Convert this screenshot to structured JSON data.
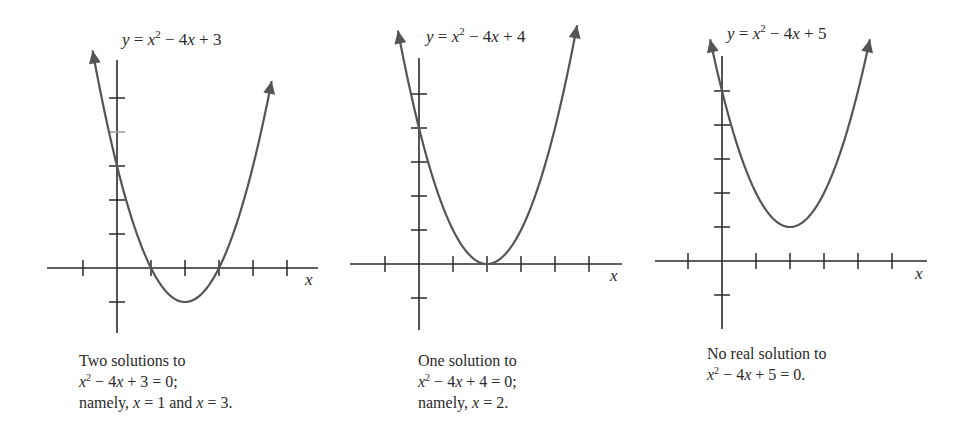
{
  "chart_data": [
    {
      "type": "line",
      "title": "y = x^2 - 4x + 3",
      "function": "x^2 - 4x + 3",
      "xlabel": "x",
      "ylabel": "",
      "xticks": [
        -1,
        0,
        1,
        2,
        3,
        4,
        5
      ],
      "yticks": [
        -1,
        1,
        2,
        3,
        4,
        5
      ],
      "vertex": [
        2,
        -1
      ],
      "roots": [
        1,
        3
      ],
      "y_intercept": 3,
      "xlim": [
        -2,
        6
      ],
      "ylim": [
        -2,
        6.3
      ],
      "grid": false,
      "caption": [
        "Two solutions to",
        "x^2 - 4x + 3 = 0;",
        "namely, x = 1 and x = 3."
      ]
    },
    {
      "type": "line",
      "title": "y = x^2 - 4x + 4",
      "function": "x^2 - 4x + 4",
      "xlabel": "x",
      "ylabel": "",
      "xticks": [
        -1,
        0,
        1,
        2,
        3,
        4,
        5
      ],
      "yticks": [
        -1,
        1,
        2,
        3,
        4,
        5
      ],
      "vertex": [
        2,
        0
      ],
      "roots": [
        2
      ],
      "y_intercept": 4,
      "xlim": [
        -2,
        6
      ],
      "ylim": [
        -2,
        6.3
      ],
      "grid": false,
      "caption": [
        "One solution to",
        "x^2 - 4x + 4 = 0;",
        "namely, x = 2."
      ]
    },
    {
      "type": "line",
      "title": "y = x^2 - 4x + 5",
      "function": "x^2 - 4x + 5",
      "xlabel": "x",
      "ylabel": "",
      "xticks": [
        -1,
        0,
        1,
        2,
        3,
        4,
        5
      ],
      "yticks": [
        -1,
        1,
        2,
        3,
        4,
        5
      ],
      "vertex": [
        2,
        1
      ],
      "roots": [],
      "y_intercept": 5,
      "xlim": [
        -2,
        6
      ],
      "ylim": [
        -2,
        6.3
      ],
      "grid": false,
      "caption": [
        "No real solution to",
        "x^2 - 4x + 5 = 0."
      ]
    }
  ],
  "graphs": [
    {
      "eq": {
        "y": "y",
        "eqs": " = ",
        "x": "x",
        "pow": "2",
        "rest1": " − 4",
        "x2": "x",
        "rest2": " + 3"
      },
      "axis_label": "x",
      "caption": {
        "line1": "Two solutions to",
        "line2": {
          "x": "x",
          "pow": "2",
          "rest": " − 4",
          "x2": "x",
          "tail": " + 3 = 0;"
        },
        "line3": {
          "pre": "namely, ",
          "x1": "x",
          "mid": " = 1 and ",
          "x2": "x",
          "tail": " = 3."
        }
      }
    },
    {
      "eq": {
        "y": "y",
        "eqs": " = ",
        "x": "x",
        "pow": "2",
        "rest1": " − 4",
        "x2": "x",
        "rest2": " + 4"
      },
      "axis_label": "x",
      "caption": {
        "line1": "One solution to",
        "line2": {
          "x": "x",
          "pow": "2",
          "rest": " − 4",
          "x2": "x",
          "tail": " + 4 = 0;"
        },
        "line3": {
          "pre": "namely, ",
          "x1": "x",
          "tail": " = 2."
        }
      }
    },
    {
      "eq": {
        "y": "y",
        "eqs": " = ",
        "x": "x",
        "pow": "2",
        "rest1": " − 4",
        "x2": "x",
        "rest2": " + 5"
      },
      "axis_label": "x",
      "caption": {
        "line1": "No real solution to",
        "line2": {
          "x": "x",
          "pow": "2",
          "rest": " − 4",
          "x2": "x",
          "tail": " + 5 = 0."
        }
      }
    }
  ],
  "style": {
    "ink": "#2a2a2a",
    "curve": "#555555",
    "faint_tick": "#9a9a9a"
  }
}
